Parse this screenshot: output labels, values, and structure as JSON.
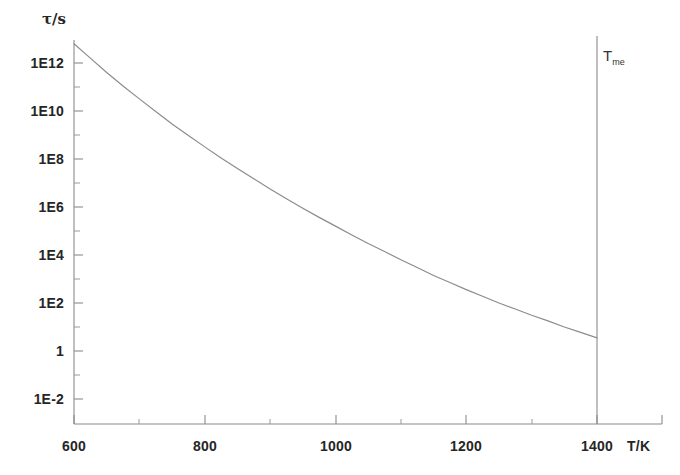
{
  "chart_data": {
    "type": "line",
    "title": "",
    "subtitle": "",
    "xlabel": "T/K",
    "ylabel": "τ/s",
    "yscale": "log",
    "xscale": "linear",
    "xlim": [
      600,
      1450
    ],
    "ylim": [
      0.001,
      100000000000000.0
    ],
    "grid": false,
    "legend": false,
    "x_ticks": [
      600,
      800,
      1000,
      1200,
      1400
    ],
    "x_tick_labels": [
      "600",
      "800",
      "1000",
      "1200",
      "1400"
    ],
    "x_minor_ticks": [
      700,
      900,
      1100,
      1300
    ],
    "y_ticks": [
      1000000000000.0,
      10000000000.0,
      100000000.0,
      1000000.0,
      10000.0,
      100,
      1,
      0.01
    ],
    "y_tick_labels": [
      "1E12",
      "1E10",
      "1E8",
      "1E6",
      "1E4",
      "1E2",
      "1",
      "1E-2"
    ],
    "y_minor_ticks": [
      10000000000000.0,
      100000000000.0,
      1000000000.0,
      10000000.0,
      100000.0,
      1000,
      10,
      0.1
    ],
    "series": [
      {
        "name": "relaxation-time",
        "color": "#8c8c8c",
        "x": [
          600,
          625,
          650,
          675,
          700,
          725,
          750,
          775,
          800,
          825,
          850,
          875,
          900,
          925,
          950,
          975,
          1000,
          1025,
          1050,
          1075,
          1100,
          1125,
          1150,
          1175,
          1200,
          1225,
          1250,
          1275,
          1300,
          1325,
          1350,
          1375,
          1400
        ],
        "y": [
          6300000000000.0,
          1600000000000.0,
          400000000000.0,
          110000000000.0,
          32000000000.0,
          9500000000.0,
          2900000000.0,
          950000000.0,
          320000000.0,
          110000000.0,
          40000000.0,
          15000000.0,
          5600000.0,
          2200000.0,
          890000.0,
          370000.0,
          160000.0,
          68000.0,
          30000.0,
          14000.0,
          6300.0,
          3000.0,
          1400.0,
          710.0,
          360.0,
          190.0,
          100.0,
          56.0,
          31.0,
          18.0,
          10.0,
          6.0,
          3.5
        ]
      }
    ],
    "annotations": [
      {
        "name": "melting-temperature-line",
        "label_main": "T",
        "label_sub": "me",
        "x": 1400,
        "type": "vertical-line"
      }
    ]
  },
  "axes": {
    "y_title": "τ/s",
    "x_title": "T/K"
  }
}
